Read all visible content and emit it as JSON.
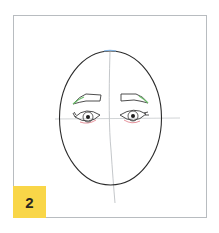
{
  "figure": {
    "step_number": "2",
    "badge_color": "#f9d648",
    "colors": {
      "outline": "#2b2b2b",
      "guide": "#b5b9bd",
      "eyebrow_accent": "#6cbf6a",
      "eye_accent": "#e07a85",
      "top_accent": "#7fb3e6"
    }
  }
}
